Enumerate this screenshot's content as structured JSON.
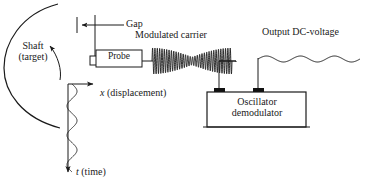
{
  "figure": {
    "stroke_color": "#1a1a1a",
    "text_color": "#1a1a1a",
    "background": "#ffffff",
    "width": 369,
    "height": 190
  },
  "labels": {
    "shaft_line1": "Shaft",
    "shaft_line2": "(target)",
    "gap": "Gap",
    "probe": "Probe",
    "modulated_carrier": "Modulated carrier",
    "output_dc_voltage": "Output DC-voltage",
    "oscillator_line1": "Oscillator",
    "oscillator_line2": "demodulator",
    "x_axis": "x (displacement)",
    "x_axis_symbol": "x",
    "x_axis_unit": " (displacement)",
    "t_axis_symbol": "t",
    "t_axis_unit": " (time)"
  },
  "components": {
    "shaft_arc": "shaft-outer-arc",
    "rotation_arrow": "shaft-rotation-arrow",
    "gap_dimension": "gap-dimension-arrow",
    "probe_box": "probe-enclosure",
    "probe_tip": "probe-sensor-tip",
    "carrier_waveform": "amplitude-modulated-carrier-trace",
    "output_waveform": "output-dc-ripple-trace",
    "oscillator_box": "oscillator-demodulator-enclosure",
    "terminal_left": "input-terminal-block",
    "terminal_right": "output-terminal-block",
    "displacement_axis": "x-displacement-axis-arrow",
    "time_axis": "t-time-axis-arrow",
    "vibration_trace": "shaft-vibration-waveform"
  },
  "chart_data": {
    "type": "line",
    "traces": [
      {
        "name": "Modulated carrier",
        "description": "Amplitude-modulated high-frequency carrier with envelope pinching at center",
        "x_range": [
          152,
          232
        ],
        "baseline_y": 61,
        "carrier_cycles": 34,
        "envelope_peak_amplitude": 13,
        "envelope_min_amplitude": 4
      },
      {
        "name": "Output DC-voltage",
        "description": "Demodulated DC level with low-amplitude ripple",
        "x_range": [
          258,
          360
        ],
        "baseline_y": 59,
        "ripple_cycles": 3,
        "ripple_amplitude": 3
      },
      {
        "name": "Shaft vibration (displacement vs time)",
        "description": "Slow lateral vibration of the shaft surface plotted against the downward time axis",
        "axis_x": 68,
        "y_range": [
          84,
          172
        ],
        "cycles": 3,
        "amplitude": 5
      }
    ],
    "axes": [
      {
        "name": "x (displacement)",
        "direction": "right",
        "origin": [
          68,
          84
        ],
        "end": [
          96,
          84
        ]
      },
      {
        "name": "t (time)",
        "direction": "down",
        "origin": [
          68,
          84
        ],
        "end": [
          68,
          178
        ]
      }
    ],
    "grid": false,
    "legend": "none"
  }
}
